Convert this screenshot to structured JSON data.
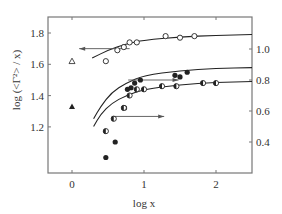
{
  "chart_data": {
    "type": "scatter",
    "title": "",
    "xlabel": "log x",
    "ylabel": "log (<Γ²> / x)",
    "ylabel_right": "",
    "xlim": [
      -0.33,
      2.5
    ],
    "ylim": [
      1.05,
      1.9
    ],
    "ylim_right": [
      0.3,
      1.2
    ],
    "x_ticks": [
      0,
      1,
      2
    ],
    "x_tick_labels": [
      "0",
      "1",
      "2"
    ],
    "y_ticks": [
      1.2,
      1.4,
      1.6,
      1.8
    ],
    "y_tick_labels": [
      "1.2",
      "1.4",
      "1.6",
      "1.8"
    ],
    "y_right_ticks": [
      0.4,
      0.6,
      0.8,
      1.0
    ],
    "y_right_tick_labels": [
      "0.4",
      "0.6",
      "0.8",
      "1.0"
    ],
    "grid": false,
    "legend": "none",
    "series": [
      {
        "name": "open circles (left axis)",
        "marker": "open-circle",
        "axis": "left",
        "points": [
          [
            0.47,
            1.62
          ],
          [
            0.63,
            1.69
          ],
          [
            0.72,
            1.71
          ],
          [
            0.8,
            1.74
          ],
          [
            0.9,
            1.74
          ],
          [
            1.3,
            1.78
          ],
          [
            1.5,
            1.77
          ],
          [
            1.7,
            1.78
          ]
        ]
      },
      {
        "name": "filled circles (right axis)",
        "marker": "filled-circle",
        "axis": "right",
        "points": [
          [
            0.47,
            0.3
          ],
          [
            0.6,
            0.4
          ],
          [
            0.73,
            0.62
          ],
          [
            0.77,
            0.74
          ],
          [
            0.82,
            0.75
          ],
          [
            0.87,
            0.78
          ],
          [
            0.95,
            0.8
          ],
          [
            1.43,
            0.83
          ],
          [
            1.5,
            0.82
          ],
          [
            1.6,
            0.85
          ]
        ]
      },
      {
        "name": "half-filled circles (right axis)",
        "marker": "half-filled-circle",
        "axis": "right",
        "points": [
          [
            0.47,
            0.47
          ],
          [
            0.58,
            0.55
          ],
          [
            0.72,
            0.62
          ],
          [
            0.8,
            0.7
          ],
          [
            0.9,
            0.74
          ],
          [
            1.0,
            0.74
          ],
          [
            1.25,
            0.76
          ],
          [
            1.45,
            0.76
          ],
          [
            1.82,
            0.78
          ],
          [
            2.0,
            0.78
          ]
        ]
      },
      {
        "name": "open triangle (left axis)",
        "marker": "open-triangle",
        "axis": "left",
        "points": [
          [
            0.0,
            1.62
          ]
        ]
      },
      {
        "name": "filled triangle (left axis)",
        "marker": "filled-triangle",
        "axis": "left",
        "points": [
          [
            0.0,
            1.33
          ]
        ]
      }
    ],
    "curves": [
      {
        "name": "fit open circles",
        "axis": "left",
        "points": [
          [
            0.28,
            1.64
          ],
          [
            0.5,
            1.69
          ],
          [
            0.75,
            1.73
          ],
          [
            1.0,
            1.755
          ],
          [
            1.5,
            1.775
          ],
          [
            2.0,
            1.785
          ],
          [
            2.5,
            1.79
          ]
        ]
      },
      {
        "name": "fit filled circles",
        "axis": "right",
        "points": [
          [
            0.3,
            0.55
          ],
          [
            0.4,
            0.63
          ],
          [
            0.55,
            0.72
          ],
          [
            0.75,
            0.78
          ],
          [
            1.0,
            0.83
          ],
          [
            1.5,
            0.86
          ],
          [
            2.0,
            0.875
          ],
          [
            2.5,
            0.88
          ]
        ]
      },
      {
        "name": "fit half-filled circles",
        "axis": "right",
        "points": [
          [
            0.3,
            0.5
          ],
          [
            0.4,
            0.58
          ],
          [
            0.55,
            0.65
          ],
          [
            0.75,
            0.7
          ],
          [
            1.0,
            0.74
          ],
          [
            1.5,
            0.77
          ],
          [
            2.0,
            0.785
          ],
          [
            2.5,
            0.79
          ]
        ]
      }
    ],
    "annotations": [
      {
        "type": "arrow",
        "direction": "left",
        "from": [
          0.8,
          1.7
        ],
        "to": [
          0.1,
          1.7
        ],
        "meaning": "open-circle series uses left axis"
      },
      {
        "type": "arrow",
        "direction": "right",
        "from": [
          0.78,
          0.8
        ],
        "to": [
          1.48,
          0.8
        ],
        "meaning": "filled-circle series uses right axis"
      },
      {
        "type": "arrow",
        "direction": "right",
        "from": [
          0.55,
          0.565
        ],
        "to": [
          1.28,
          0.565
        ],
        "meaning": "half-filled series uses right axis"
      }
    ]
  }
}
